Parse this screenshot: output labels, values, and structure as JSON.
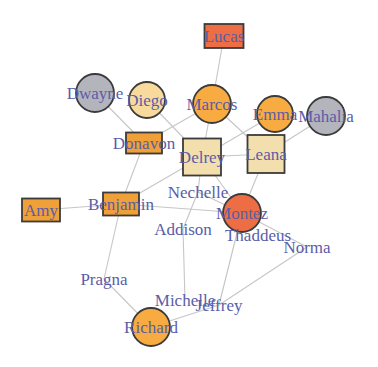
{
  "chart_data": {
    "type": "network-graph",
    "title": "",
    "canvas": {
      "width": 378,
      "height": 367,
      "background": "#ffffff"
    },
    "style": {
      "edge_color": "#c6c6c6",
      "edge_width": 1.1,
      "node_border_color": "#3b3b3b",
      "node_border_width": 1.8,
      "label_color": "#5a5da8",
      "label_font_size": 17
    },
    "colors": {
      "orange_circle": "#f7ab41",
      "orange_square": "#f0a038",
      "tomato": "#ed6e45",
      "gray": "#b4b4bc",
      "cream": "#f8da9c",
      "beige": "#f3dfad"
    },
    "nodes": [
      {
        "id": "Lucas",
        "label": "Lucas",
        "x": 224,
        "y": 36,
        "shape": "rect",
        "w": 39,
        "h": 24,
        "fill": "#ed6e45"
      },
      {
        "id": "Dwayne",
        "label": "Dwayne",
        "x": 95,
        "y": 93,
        "shape": "circle",
        "r": 19,
        "fill": "#b4b4bc"
      },
      {
        "id": "Diego",
        "label": "Diego",
        "x": 147,
        "y": 100,
        "shape": "circle",
        "r": 18,
        "fill": "#f8da9c"
      },
      {
        "id": "Marcos",
        "label": "Marcos",
        "x": 212,
        "y": 104,
        "shape": "circle",
        "r": 19,
        "fill": "#f7ab41"
      },
      {
        "id": "Emma",
        "label": "Emma",
        "x": 275,
        "y": 114,
        "shape": "circle",
        "r": 18,
        "fill": "#f7ab41"
      },
      {
        "id": "Mahalia",
        "label": "Mahalia",
        "x": 326,
        "y": 116,
        "shape": "circle",
        "r": 19,
        "fill": "#b4b4bc"
      },
      {
        "id": "Donavon",
        "label": "Donavon",
        "x": 144,
        "y": 143,
        "shape": "rect",
        "w": 36,
        "h": 21,
        "fill": "#f0a038"
      },
      {
        "id": "Delrey",
        "label": "Delrey",
        "x": 202,
        "y": 157,
        "shape": "rect",
        "w": 38,
        "h": 37,
        "fill": "#f3dfad"
      },
      {
        "id": "Leana",
        "label": "Leana",
        "x": 266,
        "y": 154,
        "shape": "rect",
        "w": 37,
        "h": 38,
        "fill": "#f3dfad"
      },
      {
        "id": "Amy",
        "label": "Amy",
        "x": 41,
        "y": 210,
        "shape": "rect",
        "w": 38,
        "h": 23,
        "fill": "#f0a038"
      },
      {
        "id": "Benjamin",
        "label": "Benjamin",
        "x": 121,
        "y": 204,
        "shape": "rect",
        "w": 36,
        "h": 23,
        "fill": "#f0a038"
      },
      {
        "id": "Montez",
        "label": "Montez",
        "x": 242,
        "y": 213,
        "shape": "circle",
        "r": 19,
        "fill": "#ed6e45"
      },
      {
        "id": "Richard",
        "label": "Richard",
        "x": 151,
        "y": 327,
        "shape": "circle",
        "r": 19,
        "fill": "#f7ab41"
      },
      {
        "id": "Nechelle",
        "label": "Nechelle",
        "x": 198,
        "y": 192,
        "shape": "none"
      },
      {
        "id": "Addison",
        "label": "Addison",
        "x": 183,
        "y": 229,
        "shape": "none"
      },
      {
        "id": "Thaddeus",
        "label": "Thaddeus",
        "x": 258,
        "y": 235,
        "shape": "none"
      },
      {
        "id": "Norma",
        "label": "Norma",
        "x": 307,
        "y": 247,
        "shape": "none"
      },
      {
        "id": "Pragna",
        "label": "Pragna",
        "x": 104,
        "y": 279,
        "shape": "none"
      },
      {
        "id": "Michelle",
        "label": "Michelle",
        "x": 185,
        "y": 300,
        "shape": "none"
      },
      {
        "id": "Jeffrey",
        "label": "Jeffrey",
        "x": 219,
        "y": 305,
        "shape": "none"
      }
    ],
    "edges": [
      [
        "Lucas",
        "Marcos"
      ],
      [
        "Dwayne",
        "Donavon"
      ],
      [
        "Diego",
        "Delrey"
      ],
      [
        "Marcos",
        "Donavon"
      ],
      [
        "Marcos",
        "Delrey"
      ],
      [
        "Marcos",
        "Leana"
      ],
      [
        "Emma",
        "Delrey"
      ],
      [
        "Mahalia",
        "Leana"
      ],
      [
        "Delrey",
        "Leana"
      ],
      [
        "Delrey",
        "Nechelle"
      ],
      [
        "Delrey",
        "Benjamin"
      ],
      [
        "Delrey",
        "Montez"
      ],
      [
        "Leana",
        "Montez"
      ],
      [
        "Amy",
        "Benjamin"
      ],
      [
        "Donavon",
        "Benjamin"
      ],
      [
        "Benjamin",
        "Pragna"
      ],
      [
        "Benjamin",
        "Montez"
      ],
      [
        "Nechelle",
        "Montez"
      ],
      [
        "Nechelle",
        "Addison"
      ],
      [
        "Addison",
        "Michelle"
      ],
      [
        "Montez",
        "Norma"
      ],
      [
        "Montez",
        "Jeffrey"
      ],
      [
        "Norma",
        "Jeffrey"
      ],
      [
        "Pragna",
        "Richard"
      ],
      [
        "Richard",
        "Jeffrey"
      ]
    ]
  }
}
